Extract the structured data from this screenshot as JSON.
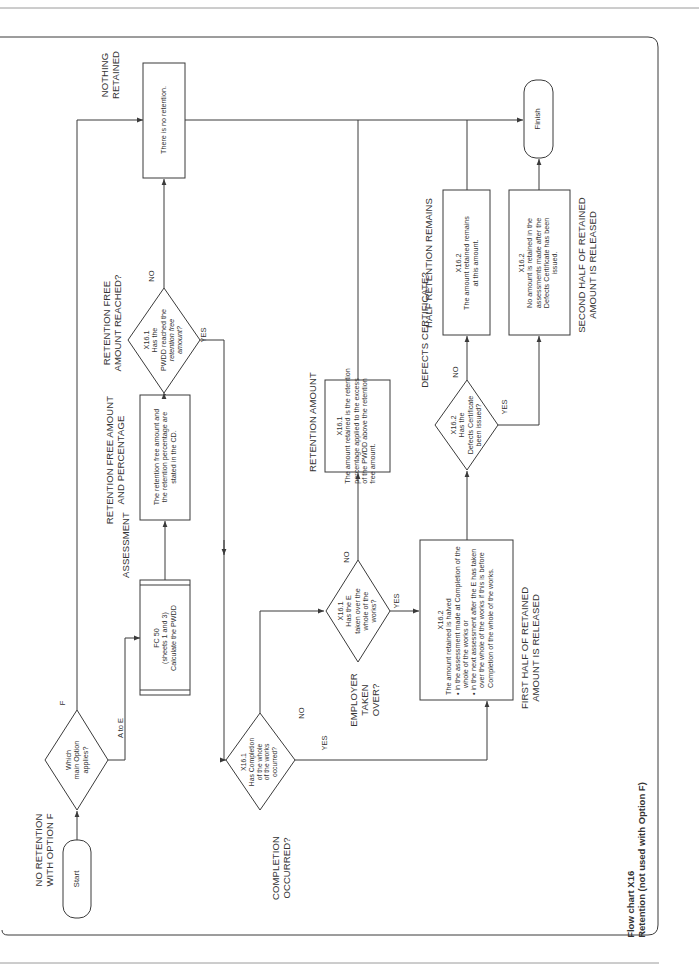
{
  "caption": {
    "title": "Flow chart X16",
    "subtitle": "Retention (not used with Option F)"
  },
  "colors": {
    "line": "#3a3a3a",
    "page_rule": "#9a9a9a",
    "background": "#ffffff"
  },
  "terminators": {
    "start": "Start",
    "finish": "Finish"
  },
  "headings": {
    "no_retention_f_1": "NO RETENTION",
    "no_retention_f_2": "WITH OPTION F",
    "assessment": "ASSESSMENT",
    "retention_free_1": "RETENTION FREE AMOUNT",
    "retention_free_2": "AND PERCENTAGE",
    "amount_reached_1": "RETENTION FREE",
    "amount_reached_2": "AMOUNT REACHED?",
    "nothing_retained_1": "NOTHING",
    "nothing_retained_2": "RETAINED",
    "completion_1": "COMPLETION",
    "completion_2": "OCCURRED?",
    "employer_1": "EMPLOYER",
    "employer_2": "TAKEN",
    "employer_3": "OVER?",
    "retention_amount": "RETENTION AMOUNT",
    "defects_certificate": "DEFECTS CERTIFICATE?",
    "half_remains": "HALF RETENTION REMAINS",
    "first_half_1": "FIRST HALF OF RETAINED",
    "first_half_2": "AMOUNT IS RELEASED",
    "second_half_1": "SECOND HALF OF RETAINED",
    "second_half_2": "AMOUNT IS RELEASED"
  },
  "decisions": {
    "main_option": {
      "lines": [
        "Which",
        "main Option",
        "applies?"
      ],
      "branch_a": "A to E",
      "branch_b": "F"
    },
    "pwdd_reached": {
      "ref": "X16.1",
      "lines": [
        "Has the",
        "PWDD reached the",
        "retention free",
        "amount?"
      ],
      "yes": "YES",
      "no": "NO"
    },
    "completion": {
      "ref": "X16.1",
      "lines": [
        "Has Completion",
        "of the whole",
        "of the works",
        "occurred?"
      ],
      "yes": "YES",
      "no": "NO"
    },
    "taken_over": {
      "ref": "X16.1",
      "lines": [
        "Has the E",
        "taken over the",
        "whole of the",
        "works?"
      ],
      "yes": "YES",
      "no": "NO"
    },
    "defects": {
      "ref": "X16.2",
      "lines": [
        "Has the",
        "Defects Certificate",
        "been issued?"
      ],
      "yes": "YES",
      "no": "NO"
    }
  },
  "processes": {
    "fc50": {
      "lines": [
        "FC 50",
        "(sheets 1 and 3)",
        "Calculate the PWDD"
      ]
    },
    "retention_free": {
      "lines": [
        "The retention free amount and",
        "the retention percentage are",
        "stated in the CD."
      ]
    },
    "no_retention": {
      "text": "There is no retention."
    },
    "retention_amount": {
      "ref": "X16.1",
      "lines": [
        "The amount retained is the retention",
        "percentage applied to the excess",
        "of the PWDD above the retention",
        "free amount."
      ]
    },
    "first_half": {
      "ref": "X16.2",
      "intro": "The amount retained is halved",
      "bullets": [
        "in the assessment made at Completion of the whole of the works or",
        "in the next assessment after the E has taken over the whole of the works if this is before Completion of the whole of the works."
      ]
    },
    "half_remains": {
      "ref": "X16.2",
      "lines": [
        "The amount retained remains",
        "at this amount."
      ]
    },
    "second_half": {
      "ref": "X16.2",
      "lines": [
        "No amount is retained in the",
        "assessments made after the",
        "Defects Certificate has been",
        "issued."
      ]
    }
  }
}
